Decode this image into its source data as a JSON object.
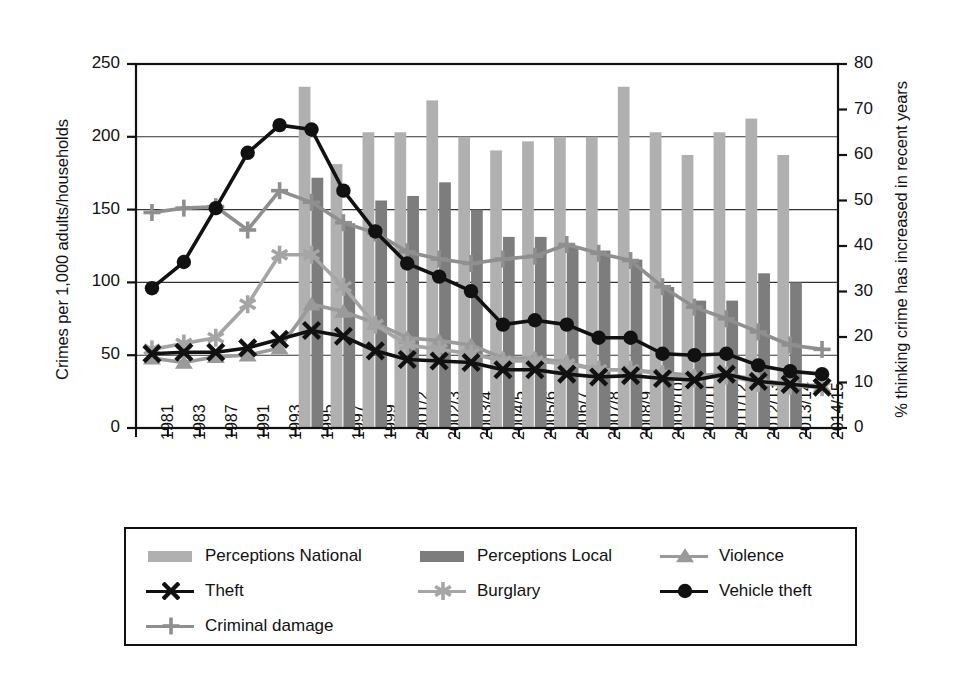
{
  "chart_data": {
    "type": "bar",
    "title": "",
    "subtitle": "",
    "xlabel": "",
    "ylabel": "Crimes per 1,000 adults/households",
    "ylabel_right": "% thinking crime has increased in recent years",
    "ylim": [
      0,
      250
    ],
    "ylim_right": [
      0,
      80
    ],
    "yticks": [
      0,
      50,
      100,
      150,
      200,
      250
    ],
    "yticks_right": [
      0,
      10,
      20,
      30,
      40,
      50,
      60,
      70,
      80
    ],
    "grid": true,
    "legend_position": "below",
    "categories": [
      "1981",
      "1983",
      "1987",
      "1991",
      "1993",
      "1995",
      "1997",
      "1999",
      "2001/2",
      "2002/3",
      "2003/4",
      "2004/5",
      "2005/6",
      "2006/7",
      "2007/8",
      "2008/9",
      "2009/10",
      "2010/11",
      "2011/12",
      "2012/13",
      "2013/14",
      "2014/15"
    ],
    "bar_axis": "right",
    "line_axis": "left",
    "bars": [
      {
        "name": "Perceptions National",
        "color": "#b0b0b0",
        "values": [
          null,
          null,
          null,
          null,
          null,
          75,
          58,
          65,
          65,
          72,
          64,
          61,
          63,
          64,
          64,
          75,
          65,
          60,
          65,
          68,
          60,
          null
        ]
      },
      {
        "name": "Perceptions Local",
        "color": "#7d7d7d",
        "values": [
          null,
          null,
          null,
          null,
          null,
          55,
          45,
          50,
          51,
          54,
          48,
          42,
          42,
          40,
          39,
          37,
          31,
          28,
          28,
          34,
          32,
          null
        ]
      }
    ],
    "series": [
      {
        "name": "Violence",
        "color": "#9a9a9a",
        "marker": "triangle",
        "values": [
          48,
          45,
          49,
          50,
          55,
          85,
          80,
          72,
          62,
          60,
          57,
          48,
          48,
          45,
          40,
          40,
          38,
          36,
          37,
          33,
          30,
          29
        ]
      },
      {
        "name": "Theft",
        "color": "#111111",
        "marker": "cross",
        "values": [
          51,
          52,
          52,
          55,
          61,
          67,
          63,
          53,
          47,
          46,
          45,
          40,
          40,
          37,
          35,
          36,
          34,
          33,
          37,
          32,
          30,
          28
        ]
      },
      {
        "name": "Burglary",
        "color": "#a5a5a5",
        "marker": "asterisk",
        "values": [
          54,
          58,
          62,
          85,
          119,
          119,
          97,
          71,
          57,
          54,
          51,
          46,
          46,
          44,
          40,
          40,
          37,
          34,
          36,
          31,
          29,
          28
        ]
      },
      {
        "name": "Vehicle theft",
        "color": "#111111",
        "marker": "circle",
        "values": [
          96,
          114,
          151,
          189,
          208,
          205,
          163,
          135,
          113,
          104,
          94,
          71,
          74,
          71,
          62,
          62,
          51,
          50,
          51,
          43,
          39,
          37
        ]
      },
      {
        "name": "Criminal damage",
        "color": "#8f8f8f",
        "marker": "plus",
        "values": [
          148,
          151,
          152,
          136,
          163,
          155,
          141,
          134,
          121,
          116,
          113,
          116,
          118,
          126,
          120,
          115,
          97,
          83,
          75,
          66,
          57,
          54
        ]
      }
    ]
  },
  "axes": {
    "left_title": "Crimes per 1,000 adults/households",
    "right_title": "% thinking crime has increased in recent years",
    "left_ticks": [
      "250",
      "200",
      "150",
      "100",
      "50",
      "0"
    ],
    "right_ticks": [
      "80",
      "70",
      "60",
      "50",
      "40",
      "30",
      "20",
      "10",
      "0"
    ],
    "x_ticks": [
      "1981",
      "1983",
      "1987",
      "1991",
      "1993",
      "1995",
      "1997",
      "1999",
      "2001/2",
      "2002/3",
      "2003/4",
      "2004/5",
      "2005/6",
      "2006/7",
      "2007/8",
      "2008/9",
      "2009/10",
      "2010/11",
      "2011/12",
      "2012/13",
      "2013/14",
      "2014/15"
    ]
  },
  "legend": {
    "items": [
      {
        "label": "Perceptions National",
        "kind": "swatch",
        "color": "#b0b0b0",
        "marker": "none"
      },
      {
        "label": "Perceptions Local",
        "kind": "swatch",
        "color": "#7d7d7d",
        "marker": "none"
      },
      {
        "label": "Violence",
        "kind": "line",
        "color": "#9a9a9a",
        "marker": "triangle"
      },
      {
        "label": "Theft",
        "kind": "line",
        "color": "#111111",
        "marker": "cross"
      },
      {
        "label": "Burglary",
        "kind": "line",
        "color": "#a5a5a5",
        "marker": "asterisk"
      },
      {
        "label": "Vehicle theft",
        "kind": "line",
        "color": "#111111",
        "marker": "circle"
      },
      {
        "label": "Criminal damage",
        "kind": "line",
        "color": "#8f8f8f",
        "marker": "plus"
      }
    ]
  }
}
